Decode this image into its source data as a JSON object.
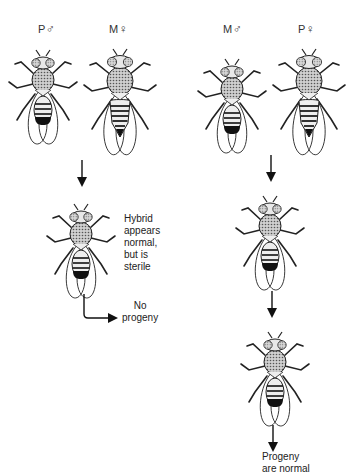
{
  "diagram": {
    "left_cross": {
      "male_parent": {
        "strain": "P",
        "sex_symbol": "♂",
        "sex": "male"
      },
      "female_parent": {
        "strain": "M",
        "sex_symbol": "♀",
        "sex": "female"
      },
      "offspring_note": "Hybrid\nappears\nnormal,\nbut is\nsterile",
      "offspring_note_lines": [
        "Hybrid",
        "appears",
        "normal,",
        "but is",
        "sterile"
      ],
      "outcome_lines": [
        "No",
        "progeny"
      ]
    },
    "right_cross": {
      "male_parent": {
        "strain": "M",
        "sex_symbol": "♂",
        "sex": "male"
      },
      "female_parent": {
        "strain": "P",
        "sex_symbol": "♀",
        "sex": "female"
      },
      "outcome_lines": [
        "Progeny",
        "are normal"
      ]
    }
  },
  "icons": {
    "fly": "drosophila-fly-icon",
    "arrow": "arrow-down-icon",
    "bent_arrow": "arrow-bent-right-icon"
  },
  "colors": {
    "ink": "#1a1a1a",
    "background": "#ffffff"
  }
}
